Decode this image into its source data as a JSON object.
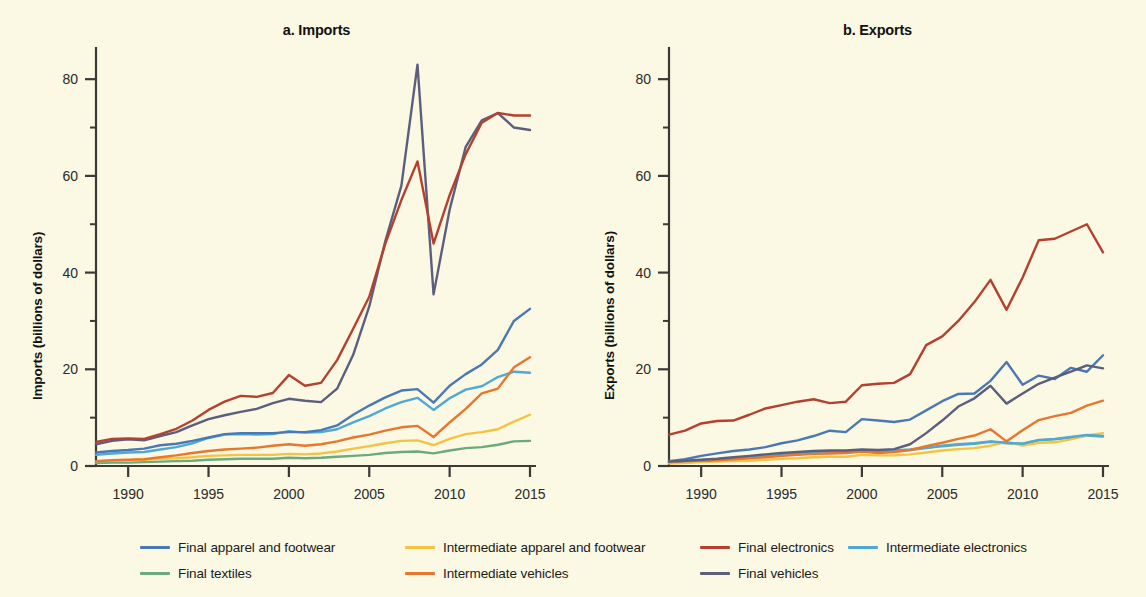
{
  "figure": {
    "background_color": "#fbf8e3"
  },
  "panels": [
    {
      "id": "imports",
      "title": "a. Imports",
      "ylabel": "Imports (billions of dollars)"
    },
    {
      "id": "exports",
      "title": "b. Exports",
      "ylabel": "Exports (billions of dollars)"
    }
  ],
  "legend": {
    "rows": [
      [
        {
          "label": "Final apparel and footwear",
          "color": "#4a78b5",
          "x": 140,
          "text_x": 178
        },
        {
          "label": "Intermediate apparel and footwear",
          "color": "#f5c242",
          "x": 405,
          "text_x": 443
        },
        {
          "label": "Intermediate vehicles",
          "color": "#e8762c",
          "x": 405,
          "text_x": 443
        },
        {
          "label": "Final electronics",
          "color": "#b5402f",
          "x": 700,
          "text_x": 738
        },
        {
          "label": "Intermediate electronics",
          "color": "#4fa8d8",
          "x": 848,
          "text_x": 886
        }
      ]
    ],
    "items": [
      {
        "label": "Final apparel and footwear",
        "color": "#4a78b5",
        "row": 0,
        "x": 140
      },
      {
        "label": "Intermediate apparel and footwear",
        "color": "#f5c242",
        "row": 0,
        "x": 405
      },
      {
        "label": "Final electronics",
        "color": "#b5402f",
        "row": 0,
        "x": 700
      },
      {
        "label": "Intermediate electronics",
        "color": "#4fa8d8",
        "row": 0,
        "x": 848
      },
      {
        "label": "Final textiles",
        "color": "#6aab7e",
        "row": 1,
        "x": 140
      },
      {
        "label": "Intermediate vehicles",
        "color": "#e8762c",
        "row": 1,
        "x": 405
      },
      {
        "label": "Final vehicles",
        "color": "#5b5f7d",
        "row": 1,
        "x": 700
      }
    ]
  },
  "chart_data": {
    "type": "line",
    "panel_count": 2,
    "xlabel": "",
    "xlim": [
      1988,
      2015
    ],
    "ylim": [
      0,
      85
    ],
    "yticks": [
      0,
      20,
      40,
      60,
      80
    ],
    "yticks_minor": [
      10,
      30,
      50,
      70
    ],
    "xticks": [
      1990,
      1995,
      2000,
      2005,
      2010,
      2015
    ],
    "grid": false,
    "legend_position": "bottom",
    "x": [
      1988,
      1989,
      1990,
      1991,
      1992,
      1993,
      1994,
      1995,
      1996,
      1997,
      1998,
      1999,
      2000,
      2001,
      2002,
      2003,
      2004,
      2005,
      2006,
      2007,
      2008,
      2009,
      2010,
      2011,
      2012,
      2013,
      2014,
      2015
    ],
    "panels": [
      {
        "name": "a. Imports",
        "ylabel": "Imports (billions of dollars)",
        "series": [
          {
            "name": "Final apparel and footwear",
            "color": "#4a78b5",
            "values": [
              2.8,
              3.1,
              3.3,
              3.6,
              4.3,
              4.6,
              5.2,
              5.9,
              6.6,
              6.8,
              6.8,
              6.8,
              7.0,
              7.0,
              7.4,
              8.4,
              10.6,
              12.5,
              14.2,
              15.6,
              15.9,
              13.1,
              16.6,
              19.0,
              21.0,
              24.0,
              30.0,
              32.5
            ]
          },
          {
            "name": "Intermediate apparel and footwear",
            "color": "#f5c242",
            "values": [
              1.0,
              1.1,
              1.2,
              1.3,
              1.5,
              1.6,
              1.8,
              2.1,
              2.2,
              2.3,
              2.3,
              2.3,
              2.5,
              2.4,
              2.6,
              3.0,
              3.6,
              4.1,
              4.7,
              5.2,
              5.3,
              4.3,
              5.6,
              6.6,
              7.0,
              7.6,
              9.2,
              10.6
            ]
          },
          {
            "name": "Final electronics",
            "color": "#b5402f",
            "values": [
              5.0,
              5.6,
              5.7,
              5.6,
              6.6,
              7.7,
              9.4,
              11.6,
              13.3,
              14.5,
              14.3,
              15.1,
              18.8,
              16.6,
              17.2,
              21.9,
              28.4,
              35.0,
              46.0,
              55.0,
              63.0,
              46.0,
              56.0,
              64.5,
              71.0,
              73.0,
              72.5,
              72.5
            ]
          },
          {
            "name": "Intermediate electronics",
            "color": "#4fa8d8",
            "values": [
              2.3,
              2.6,
              2.8,
              2.9,
              3.4,
              3.9,
              4.7,
              5.8,
              6.5,
              6.6,
              6.5,
              6.6,
              7.2,
              6.9,
              7.0,
              7.6,
              9.0,
              10.3,
              11.9,
              13.2,
              14.1,
              11.6,
              14.0,
              15.8,
              16.5,
              18.4,
              19.5,
              19.3
            ]
          },
          {
            "name": "Final textiles",
            "color": "#6aab7e",
            "values": [
              0.6,
              0.7,
              0.7,
              0.8,
              0.9,
              1.0,
              1.1,
              1.3,
              1.4,
              1.5,
              1.5,
              1.5,
              1.7,
              1.6,
              1.7,
              1.9,
              2.1,
              2.3,
              2.7,
              2.9,
              3.0,
              2.6,
              3.2,
              3.7,
              3.9,
              4.4,
              5.1,
              5.2
            ]
          },
          {
            "name": "Intermediate vehicles",
            "color": "#e8762c",
            "values": [
              1.0,
              1.2,
              1.3,
              1.4,
              1.8,
              2.2,
              2.7,
              3.1,
              3.4,
              3.6,
              3.8,
              4.2,
              4.5,
              4.2,
              4.5,
              5.1,
              5.9,
              6.5,
              7.3,
              8.0,
              8.3,
              6.0,
              9.0,
              11.8,
              15.0,
              16.0,
              20.4,
              22.5
            ]
          },
          {
            "name": "Final vehicles",
            "color": "#5b5f7d",
            "values": [
              4.5,
              5.2,
              5.5,
              5.3,
              6.2,
              7.0,
              8.4,
              9.7,
              10.5,
              11.2,
              11.8,
              13.0,
              13.9,
              13.5,
              13.2,
              16.0,
              23.0,
              33.0,
              46.5,
              58.0,
              83.0,
              35.5,
              53.0,
              66.0,
              71.5,
              73.0,
              70.0,
              69.5
            ]
          }
        ]
      },
      {
        "name": "b. Exports",
        "ylabel": "Exports (billions of dollars)",
        "series": [
          {
            "name": "Final apparel and footwear",
            "color": "#4a78b5",
            "values": [
              1.0,
              1.4,
              2.1,
              2.6,
              3.1,
              3.4,
              3.9,
              4.7,
              5.3,
              6.2,
              7.3,
              7.0,
              9.7,
              9.4,
              9.1,
              9.6,
              11.5,
              13.4,
              14.9,
              15.0,
              17.6,
              21.5,
              16.8,
              18.7,
              18.0,
              20.3,
              19.5,
              22.9
            ]
          },
          {
            "name": "Intermediate apparel and footwear",
            "color": "#f5c242",
            "values": [
              0.5,
              0.6,
              0.8,
              0.9,
              1.0,
              1.1,
              1.3,
              1.5,
              1.6,
              1.8,
              1.9,
              1.9,
              2.3,
              2.2,
              2.2,
              2.4,
              2.8,
              3.2,
              3.5,
              3.7,
              4.2,
              5.0,
              4.2,
              4.8,
              4.9,
              5.5,
              6.3,
              6.8
            ]
          },
          {
            "name": "Final electronics",
            "color": "#b5402f",
            "values": [
              6.5,
              7.3,
              8.8,
              9.3,
              9.4,
              10.6,
              11.9,
              12.6,
              13.3,
              13.8,
              13.0,
              13.3,
              16.7,
              17.0,
              17.2,
              19.0,
              25.0,
              26.8,
              30.0,
              33.9,
              38.5,
              32.3,
              39.0,
              46.7,
              47.0,
              48.5,
              50.0,
              44.2
            ]
          },
          {
            "name": "Intermediate electronics",
            "color": "#4fa8d8",
            "values": [
              0.8,
              1.0,
              1.2,
              1.4,
              1.6,
              1.8,
              2.0,
              2.3,
              2.5,
              2.8,
              2.9,
              2.9,
              3.3,
              3.1,
              3.2,
              3.4,
              3.8,
              4.2,
              4.5,
              4.7,
              5.1,
              4.8,
              4.6,
              5.4,
              5.6,
              6.0,
              6.4,
              6.2
            ]
          },
          {
            "name": "Final textiles",
            "color": "#6aab7e",
            "values": [
              0.7,
              0.9,
              1.1,
              1.3,
              1.5,
              1.7,
              1.9,
              2.2,
              2.4,
              2.7,
              2.8,
              2.8,
              3.2,
              3.0,
              3.1,
              3.3,
              3.7,
              4.1,
              4.4,
              4.6,
              5.0,
              4.7,
              4.6,
              5.3,
              5.5,
              5.9,
              6.3,
              6.1
            ]
          },
          {
            "name": "Intermediate vehicles",
            "color": "#e8762c",
            "values": [
              0.8,
              1.0,
              1.1,
              1.2,
              1.4,
              1.6,
              1.8,
              2.1,
              2.3,
              2.5,
              2.6,
              2.7,
              3.0,
              2.7,
              2.9,
              3.3,
              4.1,
              4.8,
              5.6,
              6.3,
              7.6,
              5.1,
              7.4,
              9.5,
              10.3,
              11.0,
              12.5,
              13.5
            ]
          },
          {
            "name": "Final vehicles",
            "color": "#5b5f7d",
            "values": [
              0.9,
              1.1,
              1.3,
              1.5,
              1.8,
              2.1,
              2.4,
              2.7,
              2.9,
              3.1,
              3.2,
              3.2,
              3.4,
              3.3,
              3.5,
              4.5,
              6.8,
              9.4,
              12.3,
              14.0,
              16.6,
              12.9,
              15.0,
              17.0,
              18.3,
              19.5,
              20.8,
              20.2
            ]
          }
        ]
      }
    ]
  }
}
